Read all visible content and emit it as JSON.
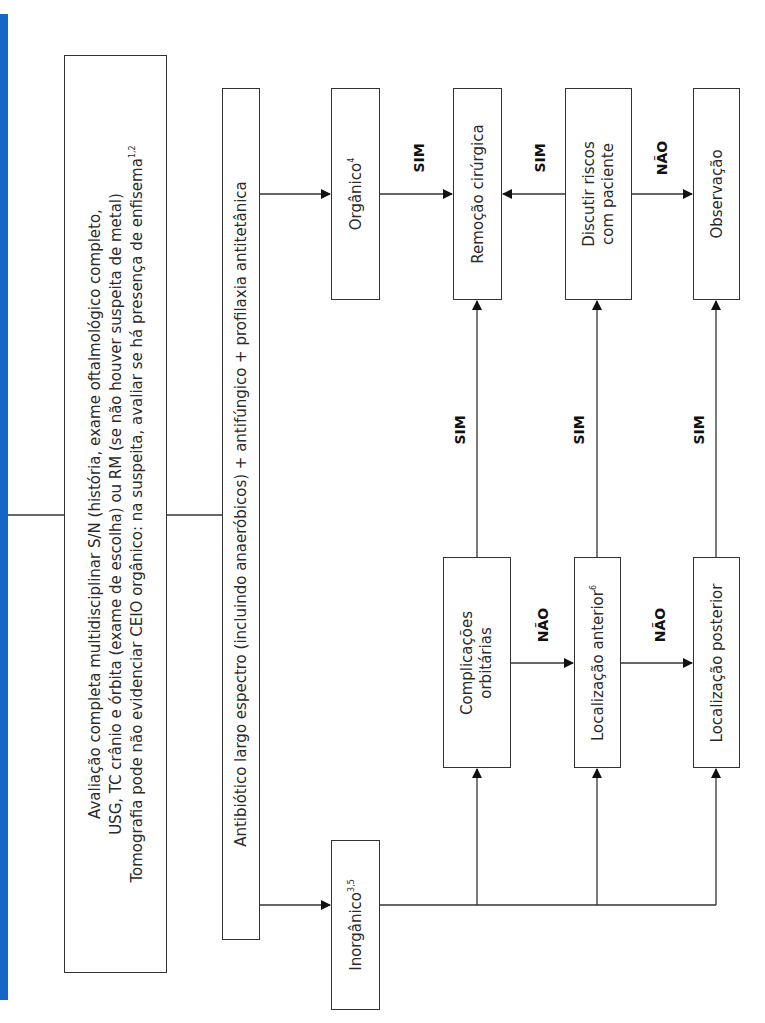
{
  "diagram": {
    "orientation": "rotated-90-ccw",
    "accent_color": "#1566c6",
    "nodes": {
      "avaliacao": {
        "line1": "Avaliação completa multidisciplinar S/N (história, exame oftalmológico completo,",
        "line2": "USG, TC crânio e órbita (exame de escolha) ou RM (se não houver suspeita de metal)",
        "line3": "Tomografia pode não evidenciar CEIO orgânico: na suspeita, avaliar se há presença de enfisema",
        "line3_sup": "1,2"
      },
      "antibiotico": {
        "text": "Antibiótico largo espectro (incluindo anaeróbicos) + antifúngico + profilaxia antitetânica"
      },
      "organico": {
        "text": "Orgânico",
        "sup": "4"
      },
      "inorganico": {
        "text": "Inorgânico",
        "sup": "3,5"
      },
      "remocao": {
        "text": "Remoção cirúrgica"
      },
      "discutir": {
        "line1": "Discutir riscos",
        "line2": "com paciente"
      },
      "observacao": {
        "text": "Observação"
      },
      "complicacoes": {
        "line1": "Complicações",
        "line2": "orbitárias"
      },
      "loc_anterior": {
        "text": "Localização anterior",
        "sup": "6"
      },
      "loc_posterior": {
        "text": "Localização posterior"
      }
    },
    "edge_labels": {
      "organico_to_remocao": "SIM",
      "discutir_to_remocao": "SIM",
      "discutir_to_observacao": "NÃO",
      "complicacoes_to_remocao": "SIM",
      "anterior_to_discutir": "SIM",
      "posterior_to_observacao": "SIM",
      "complicacoes_to_anterior": "NÃO",
      "anterior_to_posterior": "NÃO"
    }
  }
}
